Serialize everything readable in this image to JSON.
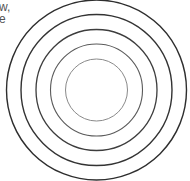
{
  "text_fragments": [
    "w,",
    "e"
  ],
  "diagram": {
    "type": "concentric-circles",
    "center": [
      96.5,
      90
    ],
    "rings": [
      {
        "r": 90,
        "stroke": "#2e2e2e",
        "width": 1.4
      },
      {
        "r": 75.5,
        "stroke": "#333333",
        "width": 1.4
      },
      {
        "r": 60.5,
        "stroke": "#3d3d3d",
        "width": 1.3
      },
      {
        "r": 46,
        "stroke": "#5a5a5a",
        "width": 1.1
      },
      {
        "r": 31,
        "stroke": "#8a8a8a",
        "width": 1.0
      }
    ]
  }
}
